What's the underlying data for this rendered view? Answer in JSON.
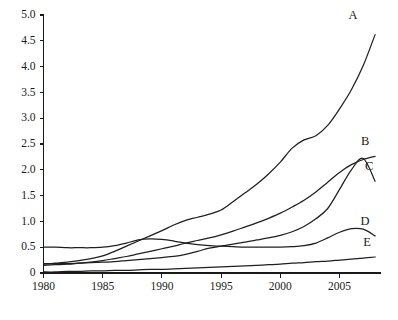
{
  "chart_data": {
    "type": "line",
    "title": "",
    "xlabel": "",
    "ylabel": "",
    "xlim": [
      1980,
      2008.5
    ],
    "ylim": [
      0.0,
      5.0
    ],
    "grid": false,
    "legend_position": "inline-right-end",
    "xticks": [
      1980,
      1985,
      1990,
      1995,
      2000,
      2005
    ],
    "xticklabels": [
      "1980",
      "1985",
      "1990",
      "1995",
      "2000",
      "2005"
    ],
    "yticks": [
      0.0,
      0.5,
      1.0,
      1.5,
      2.0,
      2.5,
      3.0,
      3.5,
      4.0,
      4.5,
      5.0
    ],
    "yticklabels": [
      "0",
      "0.5",
      "1.0",
      "1.5",
      "2.0",
      "2.5",
      "3.0",
      "3.5",
      "4.0",
      "4.5",
      "5.0"
    ],
    "x": [
      1980,
      1981,
      1982,
      1983,
      1984,
      1985,
      1986,
      1987,
      1988,
      1989,
      1990,
      1991,
      1992,
      1993,
      1994,
      1995,
      1996,
      1997,
      1998,
      1999,
      2000,
      2001,
      2002,
      2003,
      2004,
      2005,
      2006,
      2007,
      2008
    ],
    "series": [
      {
        "name": "A",
        "label": "A",
        "values": [
          0.17,
          0.19,
          0.21,
          0.24,
          0.28,
          0.33,
          0.42,
          0.52,
          0.62,
          0.72,
          0.82,
          0.93,
          1.02,
          1.08,
          1.14,
          1.22,
          1.38,
          1.55,
          1.72,
          1.92,
          2.15,
          2.42,
          2.58,
          2.66,
          2.86,
          3.18,
          3.55,
          4.02,
          4.62
        ]
      },
      {
        "name": "B",
        "label": "B",
        "values": [
          0.15,
          0.16,
          0.17,
          0.19,
          0.21,
          0.24,
          0.28,
          0.32,
          0.37,
          0.42,
          0.47,
          0.52,
          0.58,
          0.63,
          0.68,
          0.74,
          0.81,
          0.89,
          0.97,
          1.06,
          1.16,
          1.28,
          1.41,
          1.57,
          1.76,
          1.95,
          2.1,
          2.2,
          2.26
        ]
      },
      {
        "name": "C",
        "label": "C",
        "values": [
          0.18,
          0.18,
          0.18,
          0.19,
          0.2,
          0.21,
          0.22,
          0.24,
          0.26,
          0.28,
          0.3,
          0.32,
          0.36,
          0.42,
          0.48,
          0.52,
          0.56,
          0.6,
          0.64,
          0.68,
          0.73,
          0.8,
          0.9,
          1.05,
          1.25,
          1.62,
          2.0,
          2.22,
          1.78
        ]
      },
      {
        "name": "D",
        "label": "D",
        "values": [
          0.5,
          0.5,
          0.49,
          0.49,
          0.49,
          0.5,
          0.53,
          0.58,
          0.64,
          0.66,
          0.65,
          0.62,
          0.58,
          0.55,
          0.53,
          0.52,
          0.51,
          0.5,
          0.5,
          0.5,
          0.5,
          0.51,
          0.53,
          0.58,
          0.68,
          0.79,
          0.86,
          0.85,
          0.72
        ]
      },
      {
        "name": "E",
        "label": "E",
        "values": [
          0.02,
          0.02,
          0.03,
          0.03,
          0.04,
          0.04,
          0.05,
          0.05,
          0.06,
          0.07,
          0.07,
          0.08,
          0.09,
          0.1,
          0.11,
          0.12,
          0.13,
          0.14,
          0.15,
          0.16,
          0.17,
          0.19,
          0.2,
          0.22,
          0.23,
          0.25,
          0.27,
          0.29,
          0.31
        ]
      }
    ]
  },
  "caption": {
    "text": ""
  }
}
